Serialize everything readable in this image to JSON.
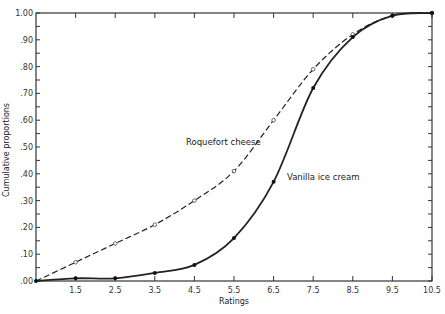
{
  "chart_data": {
    "type": "line",
    "title": "",
    "xlabel": "Ratings",
    "ylabel": "Cumulative proportions",
    "x": [
      0.5,
      1.5,
      2.5,
      3.5,
      4.5,
      5.5,
      6.5,
      7.5,
      8.5,
      9.5,
      10.5
    ],
    "x_tick_labels": [
      "1.5",
      "2.5",
      "3.5",
      "4.5",
      "5.5",
      "6.5",
      "7.5",
      "8.5",
      "9.5",
      "10.5"
    ],
    "y_tick_labels": [
      ".00",
      ".10",
      ".20",
      ".30",
      ".40",
      ".50",
      ".60",
      ".70",
      ".80",
      ".90",
      "1.00"
    ],
    "xlim": [
      0.5,
      10.5
    ],
    "ylim": [
      0.0,
      1.0
    ],
    "grid": false,
    "legend": "inline labels",
    "series": [
      {
        "name": "Roquefort cheese",
        "style": "dashed",
        "marker": "open-circle",
        "values": [
          0.0,
          0.07,
          0.14,
          0.21,
          0.3,
          0.41,
          0.6,
          0.79,
          0.92,
          0.99,
          1.0
        ]
      },
      {
        "name": "Vanilla ice cream",
        "style": "solid",
        "marker": "filled-circle",
        "values": [
          0.0,
          0.01,
          0.01,
          0.03,
          0.06,
          0.16,
          0.37,
          0.72,
          0.91,
          0.99,
          1.0
        ]
      }
    ]
  }
}
